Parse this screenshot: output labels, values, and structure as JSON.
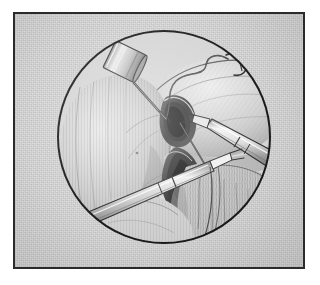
{
  "figure": {
    "title": "Laparoscopic surgical view",
    "caption": "",
    "medium": "pen-and-ink medical illustration, grayscale",
    "frame": {
      "shape": "rectangle",
      "border_color": "#2b2b2b",
      "border_width_px": 2,
      "background_color": "#d9d9d9",
      "page_background": "#ffffff"
    },
    "viewport": {
      "shape": "circle",
      "label": "endoscope-circular-field-of-view",
      "outline_color": "#1a1a1a",
      "center_x": 110,
      "center_y": 110,
      "radius": 107
    }
  },
  "palette": {
    "paper": "#d9d9d9",
    "ink": "#1a1a1a",
    "tissue_light": "#e3e3e3",
    "tissue_mid": "#bdbdbd",
    "tissue_shadow": "#8d8d8d",
    "tissue_dark": "#5e5e5e",
    "metal_light": "#f2f2f2",
    "metal_mid": "#c9c9c9",
    "metal_dark": "#7a7a7a",
    "void": "#3a3a3a"
  },
  "scene": {
    "name": "laparoscopic-suturing-of-hiatal-defect",
    "anatomy": [
      {
        "id": "upper-organ-mass",
        "label": "stomach / fundus (upper right mass)",
        "region": "upper-right",
        "shading": "cross-hatched rounded mass with highlight along upper edge"
      },
      {
        "id": "left-organ-lobe",
        "label": "organ lobe (left)",
        "region": "left-center",
        "shading": "vertical hatching, rounded convex surface"
      },
      {
        "id": "central-defect",
        "label": "figure-eight tissue defect / suture loops",
        "region": "center",
        "shading": "two dark elongated openings forming a figure-eight"
      },
      {
        "id": "omental-fat",
        "label": "omentum / fatty tissue drape",
        "region": "lower-right",
        "shading": "dense vertical stipple and hatch strands"
      },
      {
        "id": "lower-tissue-fold",
        "label": "tissue fold (lower center)",
        "region": "lower-center",
        "shading": "broad soft-shaded fold"
      }
    ],
    "instruments": [
      {
        "id": "probe-trocar",
        "label": "cylindrical probe / cannula tip",
        "entry": "upper-left",
        "tip_direction": "down-right",
        "material": "polished metal"
      },
      {
        "id": "needle-driver-right",
        "label": "laparoscopic needle driver / grasper",
        "entry": "right edge",
        "tip_direction": "left, toward center",
        "material": "polished metal shaft with jaw tip"
      },
      {
        "id": "grasper-lower-left",
        "label": "laparoscopic grasper shaft",
        "entry": "lower-left",
        "tip_direction": "up-right",
        "material": "polished metal shaft with jaw tip"
      },
      {
        "id": "suture-thread",
        "label": "suture thread with needle",
        "path": "wavy line across upper field ending in curved needle",
        "material": "fine dark filament"
      }
    ]
  }
}
